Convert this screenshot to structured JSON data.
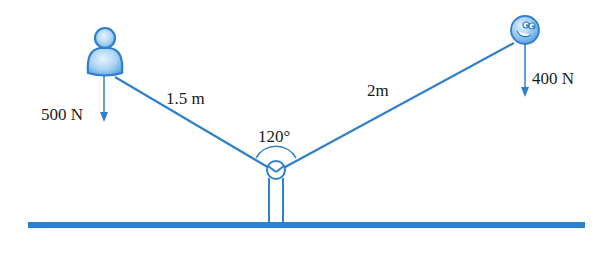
{
  "diagram": {
    "type": "lever / seesaw free-body diagram",
    "colors": {
      "line": "#2f7fcc",
      "ground": "#2b80d0",
      "figure_fill": "#a9d3f2",
      "figure_stroke": "#2f7fcc",
      "text": "#1a1a1a"
    },
    "left_figure": {
      "icon": "person-icon",
      "force_label": "500 N",
      "arm_label": "1.5 m"
    },
    "right_figure": {
      "icon": "smiley-ball-icon",
      "force_label": "400 N",
      "arm_label": "2m"
    },
    "pivot": {
      "angle_label": "120°"
    }
  }
}
